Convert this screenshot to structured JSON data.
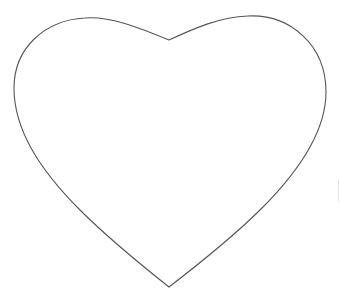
{
  "figure": {
    "shape": "heart-outline",
    "stroke_color": "#555555",
    "fill_color": "#ffffff",
    "background": "#ffffff"
  }
}
